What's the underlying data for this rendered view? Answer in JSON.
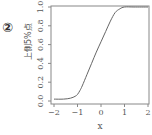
{
  "panel_label": "②",
  "chart_data": {
    "type": "line",
    "title": "",
    "xlabel": "x",
    "ylabel": "上側5%点",
    "xlim": [
      -2,
      2
    ],
    "ylim": [
      0,
      1
    ],
    "x_ticks": [
      "-2",
      "-1",
      "0",
      "1",
      "2"
    ],
    "y_ticks": [
      "0.0",
      "0.2",
      "0.4",
      "0.6",
      "0.8",
      "1.0"
    ],
    "grid": false,
    "legend": null,
    "series": [
      {
        "name": "curve",
        "x": [
          -2.0,
          -1.6,
          -1.3,
          -1.1,
          -1.0,
          -0.9,
          -0.8,
          -0.6,
          -0.4,
          -0.2,
          0.0,
          0.2,
          0.4,
          0.6,
          0.8,
          1.0,
          1.4,
          2.0
        ],
        "y": [
          0.02,
          0.02,
          0.03,
          0.05,
          0.07,
          0.11,
          0.16,
          0.28,
          0.4,
          0.52,
          0.63,
          0.74,
          0.85,
          0.94,
          0.98,
          1.0,
          1.0,
          1.0
        ]
      }
    ],
    "colors": {
      "line": "#666666",
      "axis": "#888888",
      "text": "#555555"
    }
  }
}
